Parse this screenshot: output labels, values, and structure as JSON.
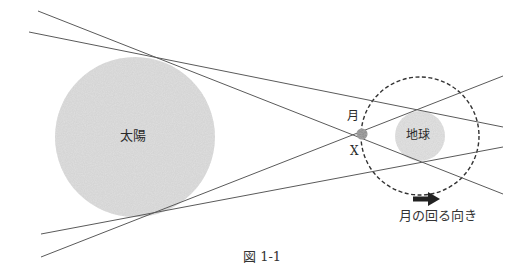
{
  "figure": {
    "caption": "図 1-1",
    "labels": {
      "sun": "太陽",
      "earth": "地球",
      "moon": "月",
      "point_x": "X",
      "moon_direction": "月の回る向き"
    },
    "colors": {
      "line": "#555555",
      "sun_fill": "#dcdcdc",
      "earth_fill": "#e0e0e0",
      "moon_fill": "#888888",
      "orbit": "#333333",
      "arrow": "#222222"
    }
  }
}
